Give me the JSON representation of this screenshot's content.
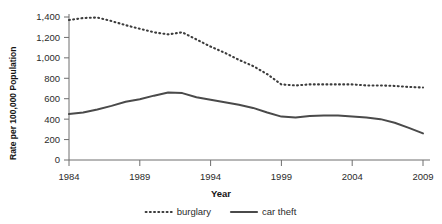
{
  "chart_data": {
    "type": "line",
    "title": "",
    "xlabel": "Year",
    "ylabel": "Rate per 100,000 Population",
    "xlim": [
      1984,
      2009
    ],
    "ylim": [
      0,
      1400
    ],
    "yticks": [
      "0",
      "200",
      "400",
      "600",
      "800",
      "1,000",
      "1,200",
      "1,400"
    ],
    "ytick_values": [
      0,
      200,
      400,
      600,
      800,
      1000,
      1200,
      1400
    ],
    "xticks": [
      "1984",
      "1989",
      "1994",
      "1999",
      "2004",
      "2009"
    ],
    "xtick_values": [
      1984,
      1989,
      1994,
      1999,
      2004,
      2009
    ],
    "grid": false,
    "legend_position": "bottom",
    "x": [
      1984,
      1985,
      1986,
      1987,
      1988,
      1989,
      1990,
      1991,
      1992,
      1993,
      1994,
      1995,
      1996,
      1997,
      1998,
      1999,
      2000,
      2001,
      2002,
      2003,
      2004,
      2005,
      2006,
      2007,
      2008,
      2009
    ],
    "series": [
      {
        "name": "burglary",
        "style": "dotted",
        "color": "#3c3c3c",
        "values": [
          1370,
          1390,
          1395,
          1360,
          1320,
          1285,
          1250,
          1230,
          1250,
          1180,
          1110,
          1050,
          980,
          920,
          840,
          740,
          730,
          740,
          740,
          740,
          740,
          730,
          730,
          725,
          715,
          710
        ]
      },
      {
        "name": "car theft",
        "style": "solid",
        "color": "#4a4a4a",
        "values": [
          450,
          465,
          495,
          530,
          570,
          595,
          630,
          660,
          655,
          615,
          590,
          565,
          540,
          510,
          465,
          425,
          415,
          430,
          435,
          435,
          425,
          415,
          400,
          365,
          315,
          260
        ]
      }
    ]
  },
  "legend": {
    "items": [
      {
        "label": "burglary",
        "style": "dotted"
      },
      {
        "label": "car theft",
        "style": "solid"
      }
    ]
  },
  "axis": {
    "x_title": "Year",
    "y_title": "Rate per 100,000 Population"
  }
}
